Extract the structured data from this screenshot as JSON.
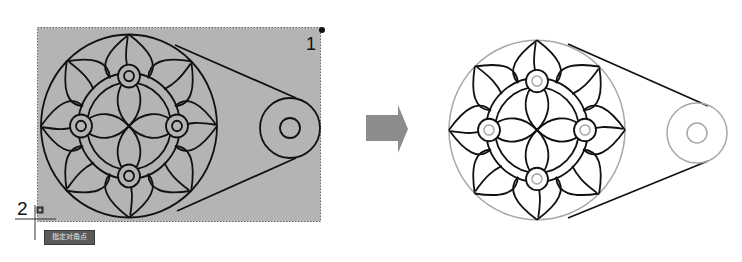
{
  "figure": {
    "left_panel": {
      "description": "crossing-window selection over drawing",
      "selection_corner_1_label": "1",
      "selection_corner_2_label": "2",
      "tooltip_text": "指定对角点",
      "selection_fill": "#b4b4b4",
      "line_color": "#111111"
    },
    "arrow": {
      "icon": "right-arrow-icon",
      "color": "#8c8c8c"
    },
    "right_panel": {
      "description": "drawing after selection — selected circles shown highlighted gray",
      "highlight_color": "#a8a8a8",
      "line_color": "#111111"
    }
  }
}
